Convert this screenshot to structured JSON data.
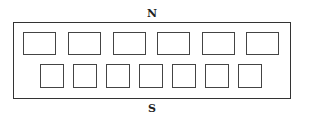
{
  "diagram": {
    "north_label": "N",
    "south_label": "S",
    "colors": {
      "stroke": "#333333",
      "background": "#ffffff"
    },
    "outer": {
      "x": 13,
      "y": 22,
      "w": 278,
      "h": 77
    },
    "top_row": [
      {
        "x": 23,
        "y": 32,
        "w": 33,
        "h": 23
      },
      {
        "x": 68,
        "y": 32,
        "w": 33,
        "h": 23
      },
      {
        "x": 113,
        "y": 32,
        "w": 33,
        "h": 23
      },
      {
        "x": 157,
        "y": 32,
        "w": 33,
        "h": 23
      },
      {
        "x": 202,
        "y": 32,
        "w": 33,
        "h": 23
      },
      {
        "x": 246,
        "y": 32,
        "w": 33,
        "h": 23
      }
    ],
    "bottom_row": [
      {
        "x": 40,
        "y": 64,
        "w": 24,
        "h": 24
      },
      {
        "x": 73,
        "y": 64,
        "w": 24,
        "h": 24
      },
      {
        "x": 106,
        "y": 64,
        "w": 24,
        "h": 24
      },
      {
        "x": 139,
        "y": 64,
        "w": 24,
        "h": 24
      },
      {
        "x": 172,
        "y": 64,
        "w": 24,
        "h": 24
      },
      {
        "x": 205,
        "y": 64,
        "w": 24,
        "h": 24
      },
      {
        "x": 238,
        "y": 64,
        "w": 24,
        "h": 24
      }
    ]
  }
}
